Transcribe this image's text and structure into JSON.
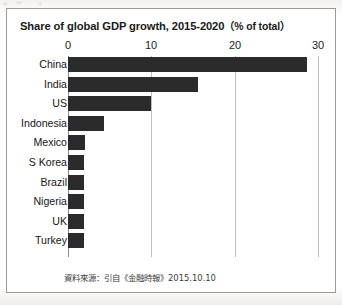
{
  "figure": {
    "title_main": "Share of global GDP growth, 2015-2020",
    "title_unit": "（% of total）",
    "source_note": "資料來源：引自《金融時報》2015.10.10"
  },
  "colors": {
    "bar": "#2b2b2b",
    "gridline": "#bdbdbd",
    "axis": "#8f8f8f",
    "frame": "#9a9a9a",
    "background": "#ffffff",
    "text": "#1a1a1a"
  },
  "chart_data": {
    "type": "bar",
    "orientation": "horizontal",
    "xlabel": "",
    "ylabel": "",
    "xlim": [
      0,
      30
    ],
    "ticks": [
      0,
      10,
      20,
      30
    ],
    "tick_labels": [
      "0",
      "10",
      "20",
      "30"
    ],
    "grid": true,
    "legend": "none",
    "categories": [
      "China",
      "India",
      "US",
      "Indonesia",
      "Mexico",
      "S Korea",
      "Brazil",
      "Nigeria",
      "UK",
      "Turkey"
    ],
    "values": [
      28.7,
      15.6,
      10.0,
      4.3,
      2.0,
      1.9,
      1.9,
      1.9,
      1.9,
      1.9
    ],
    "series": [
      {
        "name": "Share of global GDP growth",
        "values": [
          28.7,
          15.6,
          10.0,
          4.3,
          2.0,
          1.9,
          1.9,
          1.9,
          1.9,
          1.9
        ]
      }
    ],
    "units": "% of total"
  }
}
